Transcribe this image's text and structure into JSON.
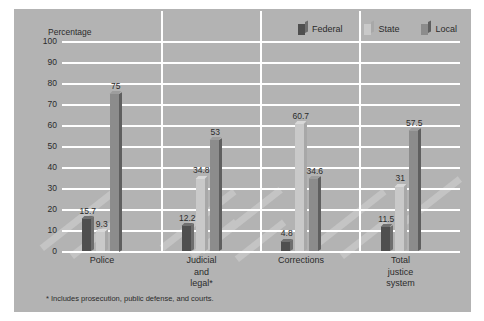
{
  "chart_data": {
    "type": "bar",
    "title": "",
    "ylabel": "Percentage",
    "xlabel": "",
    "ylim": [
      0,
      100
    ],
    "ytick_step": 10,
    "yticks": [
      "100",
      "90",
      "80",
      "70",
      "60",
      "50",
      "40",
      "30",
      "20",
      "10",
      "0"
    ],
    "grid": true,
    "legend_position": "top-right",
    "categories": [
      "Police",
      "Judicial\nand\nlegal*",
      "Corrections",
      "Total\njustice\nsystem"
    ],
    "series": [
      {
        "name": "Federal",
        "color": "#4f4f4f",
        "values": [
          15.7,
          12.2,
          4.8,
          11.5
        ]
      },
      {
        "name": "State",
        "color": "#c9c9c9",
        "values": [
          9.3,
          34.8,
          60.7,
          31
        ]
      },
      {
        "name": "Local",
        "color": "#8c8c8c",
        "values": [
          75,
          53,
          34.6,
          57.5
        ]
      }
    ],
    "value_labels": [
      [
        "15.7",
        "9.3",
        "75"
      ],
      [
        "12.2",
        "34.8",
        "53"
      ],
      [
        "4.8",
        "60.7",
        "34.6"
      ],
      [
        "11.5",
        "31",
        "57.5"
      ]
    ],
    "footnote": "* Includes prosecution, public defense, and courts.",
    "background_color": "#b3b3b3",
    "gridline_color": "#ffffff"
  }
}
